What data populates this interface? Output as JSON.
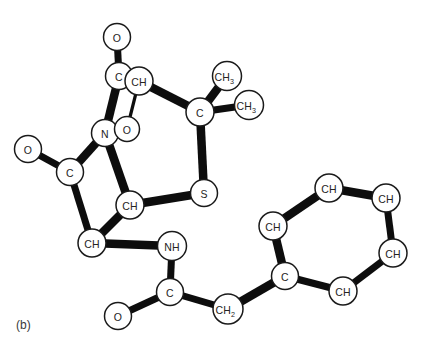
{
  "figure": {
    "panel_label": "(b)",
    "panel_label_x": 16,
    "panel_label_y": 318,
    "background_color": "#ffffff",
    "bond_color": "#0d0d0d",
    "atom_fill_color": "#ffffff",
    "atom_stroke_color": "#1a1a1a",
    "label_color": "#242424",
    "width": 421,
    "height": 344
  },
  "chart_data": {
    "type": "diagram",
    "title": "(b)",
    "diagram_kind": "ball-and-stick chemical structure",
    "molecule": "Penicillin G (benzylpenicillin)",
    "atoms": [
      {
        "id": "O1",
        "label": "O",
        "sub": "",
        "x": 117,
        "y": 37,
        "r": 13.5
      },
      {
        "id": "C1",
        "label": "C",
        "sub": "",
        "x": 119,
        "y": 76,
        "r": 13.5
      },
      {
        "id": "CH1",
        "label": "CH",
        "sub": "",
        "x": 139,
        "y": 81,
        "r": 14.0
      },
      {
        "id": "N1",
        "label": "N",
        "sub": "",
        "x": 105,
        "y": 133,
        "r": 13.5
      },
      {
        "id": "O2",
        "label": "O",
        "sub": "",
        "x": 127,
        "y": 129,
        "r": 12.5
      },
      {
        "id": "O3",
        "label": "O",
        "sub": "",
        "x": 28,
        "y": 149,
        "r": 13.5
      },
      {
        "id": "C2",
        "label": "C",
        "sub": "",
        "x": 70,
        "y": 172,
        "r": 13.5
      },
      {
        "id": "CH2a",
        "label": "CH",
        "sub": "",
        "x": 130,
        "y": 205,
        "r": 14.0
      },
      {
        "id": "CH3a",
        "label": "CH",
        "sub": "",
        "x": 92,
        "y": 243,
        "r": 14.0
      },
      {
        "id": "NH1",
        "label": "NH",
        "sub": "",
        "x": 172,
        "y": 246,
        "r": 14.5
      },
      {
        "id": "C3",
        "label": "C",
        "sub": "",
        "x": 170,
        "y": 292,
        "r": 13.5
      },
      {
        "id": "O4",
        "label": "O",
        "sub": "",
        "x": 118,
        "y": 316,
        "r": 13.5
      },
      {
        "id": "CH2b",
        "label": "CH",
        "sub": "2",
        "x": 228,
        "y": 309,
        "r": 15.0
      },
      {
        "id": "S1",
        "label": "S",
        "sub": "",
        "x": 204,
        "y": 193,
        "r": 13.5
      },
      {
        "id": "C4",
        "label": "C",
        "sub": "",
        "x": 200,
        "y": 112,
        "r": 14.0
      },
      {
        "id": "CH3b",
        "label": "CH",
        "sub": "3",
        "x": 227,
        "y": 76,
        "r": 14.5
      },
      {
        "id": "CH3c",
        "label": "CH",
        "sub": "3",
        "x": 249,
        "y": 105,
        "r": 14.5
      },
      {
        "id": "PC",
        "label": "C",
        "sub": "",
        "x": 285,
        "y": 276,
        "r": 13.5
      },
      {
        "id": "PCH1",
        "label": "CH",
        "sub": "",
        "x": 273,
        "y": 226,
        "r": 14.0
      },
      {
        "id": "PCH2",
        "label": "CH",
        "sub": "",
        "x": 329,
        "y": 188,
        "r": 14.0
      },
      {
        "id": "PCH3",
        "label": "CH",
        "sub": "",
        "x": 386,
        "y": 198,
        "r": 14.0
      },
      {
        "id": "PCH4",
        "label": "CH",
        "sub": "",
        "x": 393,
        "y": 253,
        "r": 14.0
      },
      {
        "id": "PCH5",
        "label": "CH",
        "sub": "",
        "x": 343,
        "y": 291,
        "r": 14.0
      }
    ],
    "bonds": [
      {
        "from": "O1",
        "to": "C1",
        "weight": "medium"
      },
      {
        "from": "C1",
        "to": "CH1",
        "weight": "medium"
      },
      {
        "from": "C1",
        "to": "N1",
        "weight": "thick"
      },
      {
        "from": "CH1",
        "to": "O2",
        "weight": "thin"
      },
      {
        "from": "CH1",
        "to": "C4",
        "weight": "thick"
      },
      {
        "from": "N1",
        "to": "C2",
        "weight": "thick"
      },
      {
        "from": "N1",
        "to": "CH2a",
        "weight": "thick"
      },
      {
        "from": "O3",
        "to": "C2",
        "weight": "medium"
      },
      {
        "from": "C2",
        "to": "CH3a",
        "weight": "medium"
      },
      {
        "from": "CH2a",
        "to": "CH3a",
        "weight": "thick"
      },
      {
        "from": "CH2a",
        "to": "S1",
        "weight": "thick"
      },
      {
        "from": "CH3a",
        "to": "NH1",
        "weight": "thick"
      },
      {
        "from": "NH1",
        "to": "C3",
        "weight": "medium"
      },
      {
        "from": "C3",
        "to": "O4",
        "weight": "medium"
      },
      {
        "from": "C3",
        "to": "CH2b",
        "weight": "medium"
      },
      {
        "from": "CH2b",
        "to": "PC",
        "weight": "thick"
      },
      {
        "from": "S1",
        "to": "C4",
        "weight": "thick"
      },
      {
        "from": "C4",
        "to": "CH3b",
        "weight": "thick"
      },
      {
        "from": "C4",
        "to": "CH3c",
        "weight": "medium"
      },
      {
        "from": "PC",
        "to": "PCH1",
        "weight": "thick"
      },
      {
        "from": "PCH1",
        "to": "PCH2",
        "weight": "thick"
      },
      {
        "from": "PCH2",
        "to": "PCH3",
        "weight": "thick"
      },
      {
        "from": "PCH3",
        "to": "PCH4",
        "weight": "medium"
      },
      {
        "from": "PCH4",
        "to": "PCH5",
        "weight": "medium"
      },
      {
        "from": "PCH5",
        "to": "PC",
        "weight": "medium"
      }
    ],
    "atom_labels": [
      "O",
      "C",
      "CH",
      "N",
      "O",
      "O",
      "C",
      "CH",
      "CH",
      "NH",
      "C",
      "O",
      "CH2",
      "S",
      "C",
      "CH3",
      "CH3",
      "C",
      "CH",
      "CH",
      "CH",
      "CH",
      "CH"
    ],
    "rings": [
      {
        "name": "beta-lactam",
        "members": [
          "C1",
          "N1",
          "CH2a",
          "CH1"
        ]
      },
      {
        "name": "thiazolidine",
        "members": [
          "N1",
          "CH2a",
          "S1",
          "C4",
          "CH1"
        ]
      },
      {
        "name": "benzene",
        "members": [
          "PC",
          "PCH1",
          "PCH2",
          "PCH3",
          "PCH4",
          "PCH5"
        ]
      }
    ]
  }
}
